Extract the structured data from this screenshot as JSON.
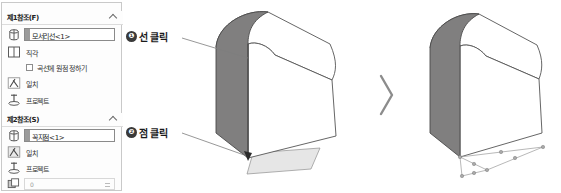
{
  "panel": {
    "sections": [
      {
        "title": "제1참조(F)",
        "collapse_icon": "chevron-up-icon",
        "selection": {
          "icon": "reference-entity-icon",
          "value": "모서리선<1>"
        },
        "rows": [
          {
            "icon": "perpendicular-icon",
            "label": "직각"
          },
          {
            "icon": "coincident-icon",
            "label": "일치"
          },
          {
            "icon": "project-icon",
            "label": "프로젝트"
          }
        ],
        "checkbox": {
          "label": "곡선에 원점 정하기",
          "checked": false
        }
      },
      {
        "title": "제2참조(S)",
        "collapse_icon": "chevron-up-icon",
        "selection": {
          "icon": "reference-entity-icon",
          "value": "꼭지점<1>"
        },
        "rows": [
          {
            "icon": "coincident-icon",
            "label": "일치"
          },
          {
            "icon": "project-icon",
            "label": "프로젝트"
          }
        ],
        "spinner": {
          "icon": "offset-distance-icon",
          "value": "0"
        }
      }
    ]
  },
  "callouts": [
    {
      "badge": "❶",
      "text": "선 클릭"
    },
    {
      "badge": "❷",
      "text": "점 클릭"
    }
  ],
  "viewport": {
    "separator_icon": "chevron-right-icon",
    "models": [
      {
        "name": "before-model",
        "shaded_face_color": "#807f7f",
        "highlight_plane": true
      },
      {
        "name": "after-model",
        "shaded_face_color": "#807f7f",
        "sketch_points": true
      }
    ]
  },
  "colors": {
    "shade": "#807f7f",
    "outline": "#555555",
    "panel_border": "#c9c9c9",
    "badge": "#3a3a3a",
    "plane": "#e3e3e3"
  }
}
